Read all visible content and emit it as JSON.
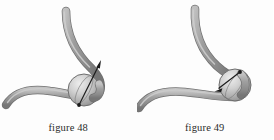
{
  "page": {
    "background_color": "#fdfdfd",
    "width": 273,
    "height": 140
  },
  "palette": {
    "tube_fill": "#919191",
    "tube_light": "#b9b9b9",
    "tube_dark": "#6f6f6f",
    "tube_outline": "#7a7a7a",
    "sphere_light": "#e2e2e2",
    "sphere_mid": "#b0b0b0",
    "sphere_dark": "#8a8a8a",
    "sphere_outline": "#6e6e6e",
    "arrow_color": "#1a1a1a",
    "caption_color": "#2b2b2b"
  },
  "figures": [
    {
      "id": "figure-48",
      "caption": "figure 48",
      "description": "Curved tube descending from upper right meeting a horizontal curved tube at a shaded sphere, with a vector arrow through the sphere pointing up and to the right.",
      "arrow": {
        "name": "velocity-vector-arrow",
        "direction": "up-right",
        "tail_x": 79,
        "tail_y": 105,
        "tip_x": 101,
        "tip_y": 61
      },
      "sphere": {
        "center_x": 84,
        "center_y": 90,
        "radius": 16
      }
    },
    {
      "id": "figure-49",
      "caption": "figure 49",
      "description": "Curved tube descending from top meeting a horizontal curved tube at a shaded sphere, with a vector arrow pointing down and to the left away from the sphere.",
      "arrow": {
        "name": "velocity-vector-arrow",
        "direction": "down-left",
        "tail_x": 103,
        "tail_y": 72,
        "tip_x": 78,
        "tip_y": 90
      },
      "sphere": {
        "center_x": 98,
        "center_y": 85,
        "radius": 16
      }
    }
  ]
}
